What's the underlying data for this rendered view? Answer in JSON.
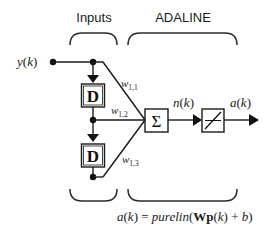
{
  "diagram": {
    "type": "block-diagram",
    "title_sections": {
      "inputs_label": "Inputs",
      "adaline_label": "ADALINE"
    },
    "input_signal": {
      "label_var": "y",
      "label_arg": "(k)"
    },
    "delay_blocks": [
      {
        "label": "D"
      },
      {
        "label": "D"
      }
    ],
    "weights": [
      {
        "base": "w",
        "sub": "1,1"
      },
      {
        "base": "w",
        "sub": "1,2"
      },
      {
        "base": "w",
        "sub": "1,3"
      }
    ],
    "summation": {
      "symbol": "Σ"
    },
    "net_input": {
      "label_var": "n",
      "label_arg": "(k)"
    },
    "transfer_function": {
      "name": "purelin",
      "icon": "linear-transfer-icon"
    },
    "output": {
      "label_var": "a",
      "label_arg": "(k)"
    },
    "equation": {
      "lhs_var": "a",
      "lhs_arg": "(k)",
      "equals": " = ",
      "func": "purelin",
      "open": "(",
      "W": "W",
      "p": "p",
      "p_arg": "(k)",
      "plus": " + ",
      "b": "b",
      "close": ")"
    },
    "colors": {
      "stroke": "#1a1a1a",
      "background": "#ffffff"
    }
  }
}
